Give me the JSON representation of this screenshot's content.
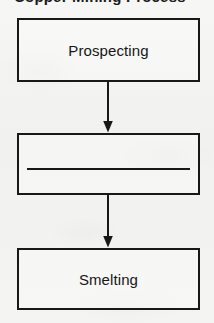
{
  "page": {
    "type": "flowchart",
    "orientation": "vertical",
    "background_color": "#f3f3f1",
    "line_color": "#181818",
    "text_color": "#161616"
  },
  "title": {
    "text": "Copper Mining Process",
    "note": "cropped off at top edge; only letter descenders visible"
  },
  "nodes": [
    {
      "id": "prospecting",
      "label": "Prospecting",
      "shape": "rectangle"
    },
    {
      "id": "redacted",
      "label": "",
      "shape": "rectangle",
      "content": "horizontal-rule"
    },
    {
      "id": "smelting",
      "label": "Smelting",
      "shape": "rectangle"
    }
  ],
  "connectors": [
    {
      "id": "connector-1",
      "from": "prospecting",
      "to": "redacted",
      "style": "arrow-down"
    },
    {
      "id": "connector-2",
      "from": "redacted",
      "to": "smelting",
      "style": "arrow-down"
    }
  ]
}
